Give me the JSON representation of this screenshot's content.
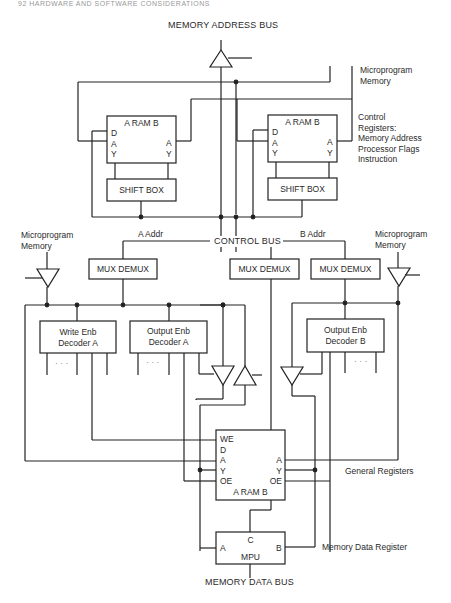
{
  "page_header": "92   HARDWARE AND SOFTWARE CONSIDERATIONS",
  "buses": {
    "memory_address_bus": "MEMORY ADDRESS BUS",
    "control_bus": "CONTROL BUS",
    "memory_data_bus": "MEMORY DATA BUS"
  },
  "labels": {
    "microprogram_memory_top": [
      "Microprogram",
      "Memory"
    ],
    "control_registers": [
      "Control",
      "Registers:",
      "Memory Address",
      "Processor Flags",
      "Instruction"
    ],
    "microprogram_memory_left": [
      "Microprogram",
      "Memory"
    ],
    "microprogram_memory_right": [
      "Microprogram",
      "Memory"
    ],
    "a_addr": "A Addr",
    "b_addr": "B Addr",
    "general_registers": "General Registers",
    "memory_data_register": "Memory Data Register"
  },
  "blocks": {
    "ram_left": {
      "title": "A RAM B",
      "left_pins": [
        "D",
        "A",
        "Y"
      ],
      "right_pins": [
        "A",
        "Y"
      ]
    },
    "ram_right": {
      "title": "A RAM B",
      "left_pins": [
        "D",
        "A",
        "Y"
      ],
      "right_pins": [
        "A",
        "Y"
      ]
    },
    "shift_left": "SHIFT BOX",
    "shift_right": "SHIFT BOX",
    "mux_1": "MUX DEMUX",
    "mux_2": "MUX DEMUX",
    "mux_3": "MUX DEMUX",
    "write_dec_a": [
      "Write Enb",
      "Decoder A"
    ],
    "output_dec_a": [
      "Output Enb",
      "Decoder A"
    ],
    "output_dec_b": [
      "Output Enb",
      "Decoder B"
    ],
    "ellipsis": "· · ·",
    "ram_main": {
      "title": "A RAM B",
      "left_pins": [
        "WE",
        "D",
        "A",
        "Y",
        "OE"
      ],
      "right_pins": [
        "A",
        "Y",
        "OE"
      ]
    },
    "mpu": {
      "title": "MPU",
      "top_pin": "C",
      "left_pin": "A",
      "right_pin": "B"
    }
  }
}
